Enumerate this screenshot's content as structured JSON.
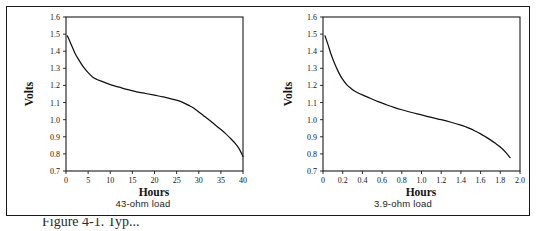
{
  "figure": {
    "caption": "Figure 4-1. Typ...",
    "background": "#ffffff",
    "frame_color": "#1a1a1a",
    "curve_color": "#111111"
  },
  "panels": [
    {
      "id": "left",
      "caption": "43-ohm load"
    },
    {
      "id": "right",
      "caption": "3.9-ohm load"
    }
  ],
  "chart_data": [
    {
      "type": "line",
      "id": "discharge-43-ohm",
      "title": "43-ohm load",
      "xlabel": "Hours",
      "ylabel": "Volts",
      "xlim": [
        0,
        40
      ],
      "ylim": [
        0.7,
        1.6
      ],
      "xticks": [
        0,
        5,
        10,
        15,
        20,
        25,
        30,
        35,
        40
      ],
      "xticklabels": [
        "0",
        "5",
        "10",
        "15",
        "20",
        "25",
        "30",
        "35",
        "40"
      ],
      "yticks": [
        0.7,
        0.8,
        0.9,
        1.0,
        1.1,
        1.2,
        1.3,
        1.4,
        1.5,
        1.6
      ],
      "yticklabels": [
        "0.7",
        "0.8",
        "0.9",
        "1.0",
        "1.1",
        "1.2",
        "1.3",
        "1.4",
        "1.5",
        "1.6"
      ],
      "grid": false,
      "legend": null,
      "series": [
        {
          "name": "43-ohm load",
          "x": [
            0.3,
            1.0,
            2.0,
            3.0,
            4.0,
            5.0,
            6.0,
            7.0,
            8.0,
            10.0,
            12.0,
            14.0,
            16.0,
            18.0,
            20.0,
            22.0,
            24.0,
            26.0,
            28.0,
            29.0,
            30.0,
            31.0,
            32.0,
            33.0,
            34.0,
            35.0,
            36.0,
            37.0,
            38.0,
            39.0,
            40.0
          ],
          "y": [
            1.49,
            1.45,
            1.39,
            1.345,
            1.305,
            1.275,
            1.25,
            1.235,
            1.225,
            1.205,
            1.19,
            1.175,
            1.163,
            1.153,
            1.143,
            1.133,
            1.12,
            1.105,
            1.08,
            1.065,
            1.045,
            1.025,
            1.005,
            0.985,
            0.963,
            0.942,
            0.92,
            0.895,
            0.868,
            0.835,
            0.785
          ]
        }
      ]
    },
    {
      "type": "line",
      "id": "discharge-3-9-ohm",
      "title": "3.9-ohm load",
      "xlabel": "Hours",
      "ylabel": "Volts",
      "xlim": [
        0,
        2.0
      ],
      "ylim": [
        0.7,
        1.6
      ],
      "xticks": [
        0,
        0.2,
        0.4,
        0.6,
        0.8,
        1.0,
        1.2,
        1.4,
        1.6,
        1.8,
        2.0
      ],
      "xticklabels": [
        "0",
        "0.2",
        "0.4",
        "0.6",
        "0.8",
        "1.0",
        "1.2",
        "1.4",
        "1.6",
        "1.8",
        "2.0"
      ],
      "yticks": [
        0.7,
        0.8,
        0.9,
        1.0,
        1.1,
        1.2,
        1.3,
        1.4,
        1.5,
        1.6
      ],
      "yticklabels": [
        "0.7",
        "0.8",
        "0.9",
        "1.0",
        "1.1",
        "1.2",
        "1.3",
        "1.4",
        "1.5",
        "1.6"
      ],
      "grid": false,
      "legend": null,
      "series": [
        {
          "name": "3.9-ohm load",
          "x": [
            0.02,
            0.05,
            0.08,
            0.12,
            0.16,
            0.2,
            0.24,
            0.28,
            0.32,
            0.4,
            0.48,
            0.56,
            0.64,
            0.72,
            0.8,
            0.9,
            1.0,
            1.1,
            1.2,
            1.3,
            1.4,
            1.45,
            1.5,
            1.55,
            1.6,
            1.65,
            1.7,
            1.75,
            1.8,
            1.85,
            1.9
          ],
          "y": [
            1.49,
            1.44,
            1.385,
            1.325,
            1.275,
            1.235,
            1.205,
            1.185,
            1.168,
            1.145,
            1.125,
            1.105,
            1.088,
            1.072,
            1.058,
            1.042,
            1.028,
            1.013,
            1.0,
            0.985,
            0.968,
            0.958,
            0.946,
            0.932,
            0.917,
            0.9,
            0.882,
            0.862,
            0.84,
            0.812,
            0.778
          ]
        }
      ]
    }
  ]
}
